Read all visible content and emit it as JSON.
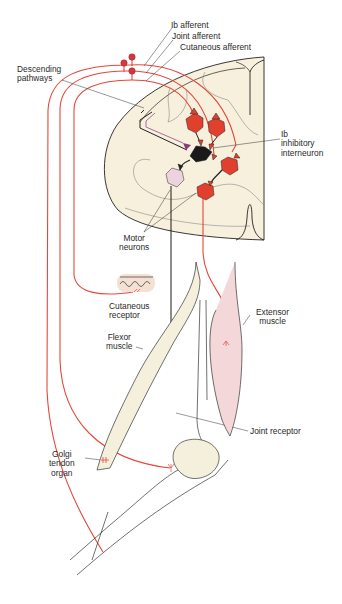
{
  "figure": {
    "colors": {
      "afferent": "#e5483a",
      "cord_fill": "#f7f0dd",
      "muscle_fill": "#f4f0dc",
      "extensor_fill": "#f3d7d9",
      "interneuron": "#1a1a1a",
      "excitatory_neuron": "#e2402f",
      "flexor_motor_neuron": "#ecd3dd",
      "descending": "#a86ca0"
    }
  },
  "labels": {
    "ib_afferent": "Ib afferent",
    "joint_afferent": "Joint afferent",
    "cutaneous_afferent": "Cutaneous afferent",
    "descending_pathways": [
      "Descending",
      "pathways"
    ],
    "ib_inhibitory_interneuron": [
      "Ib",
      "inhibitory",
      "interneuron"
    ],
    "motor_neurons": [
      "Motor",
      "neurons"
    ],
    "cutaneous_receptor": [
      "Cutaneous",
      "receptor"
    ],
    "extensor_muscle": [
      "Extensor",
      "muscle"
    ],
    "flexor_muscle": [
      "Flexor",
      "muscle"
    ],
    "joint_receptor": "Joint receptor",
    "golgi_tendon_organ": [
      "Golgi",
      "tendon",
      "organ"
    ]
  }
}
